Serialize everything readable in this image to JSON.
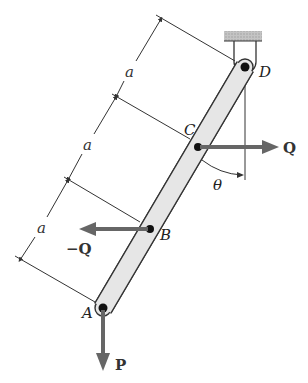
{
  "diagram": {
    "type": "statics-free-body",
    "points": {
      "A": {
        "label": "A"
      },
      "B": {
        "label": "B"
      },
      "C": {
        "label": "C"
      },
      "D": {
        "label": "D"
      }
    },
    "dimensions": [
      {
        "label": "a",
        "between": "D-C"
      },
      {
        "label": "a",
        "between": "C-B"
      },
      {
        "label": "a",
        "between": "B-A"
      }
    ],
    "forces": {
      "Q": {
        "label": "Q",
        "at": "C",
        "direction": "right"
      },
      "negQ": {
        "label": "−Q",
        "at": "B",
        "direction": "left"
      },
      "P": {
        "label": "P",
        "at": "A",
        "direction": "down"
      }
    },
    "angle": {
      "label": "θ",
      "between": "bar and vertical at C"
    },
    "support": {
      "type": "pin-hanger",
      "at": "D"
    },
    "colors": {
      "bar_fill": "#e6e6e6",
      "bar_stroke": "#333333",
      "force_arrow": "#666666",
      "support_hatch": "#b5b5b5",
      "line": "#333333"
    }
  }
}
